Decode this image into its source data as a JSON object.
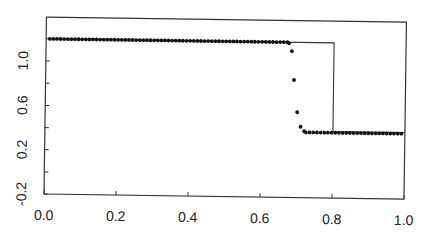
{
  "chart_data": {
    "type": "scatter",
    "title": "",
    "xlabel": "",
    "ylabel": "",
    "xlim": [
      0.0,
      1.0
    ],
    "ylim": [
      -0.2,
      1.28
    ],
    "grid": false,
    "legend": null,
    "x_ticks": [
      0.0,
      0.2,
      0.4,
      0.6,
      0.8,
      1.0
    ],
    "x_tick_labels": [
      "0.0",
      "0.2",
      "0.4",
      "0.6",
      "0.8",
      "1.0"
    ],
    "y_ticks": [
      -0.2,
      0.0,
      0.2,
      0.4,
      0.6,
      0.8,
      1.0
    ],
    "y_tick_labels": [
      "-0.2",
      "",
      "0.2",
      "",
      "0.6",
      "",
      "1.0"
    ],
    "series": [
      {
        "name": "exact",
        "style": "line",
        "color": "#333333",
        "x": [
          0.0,
          0.8,
          0.8,
          1.0
        ],
        "y": [
          1.2,
          1.2,
          0.4,
          0.4
        ]
      },
      {
        "name": "numerical",
        "style": "dots",
        "color": "#111111",
        "plateau_left": {
          "x_start": 0.01,
          "x_end": 0.67,
          "y": 1.2,
          "count": 67
        },
        "transition": {
          "x": [
            0.675,
            0.683,
            0.69,
            0.7,
            0.71,
            0.72
          ],
          "y": [
            1.19,
            1.12,
            0.86,
            0.57,
            0.44,
            0.4
          ]
        },
        "plateau_right": {
          "x_start": 0.725,
          "x_end": 0.99,
          "y": 0.39,
          "count": 27
        }
      }
    ]
  }
}
